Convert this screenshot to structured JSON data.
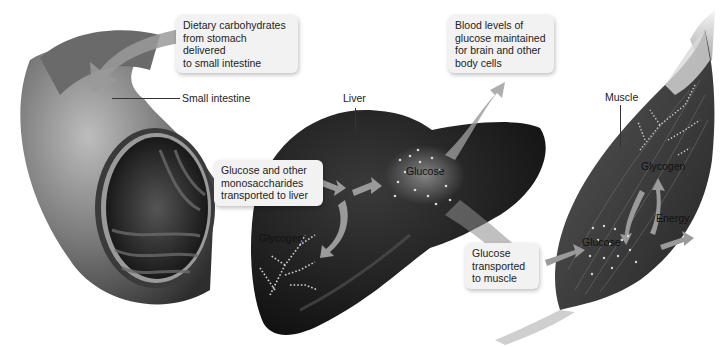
{
  "diagram": {
    "colors": {
      "background": "#ffffff",
      "callout_bg": "#f2f2f2",
      "intestine": "#5a5a5a",
      "liver": "#1e1e1e",
      "muscle": "#3c3c3c",
      "arrow": "#9a9a9a",
      "dots": "#d8d8d8"
    },
    "callouts": {
      "dietary": "Dietary carbohydrates\nfrom stomach delivered\nto small intestine",
      "to_liver": "Glucose and other\nmonosaccharides\ntransported to liver",
      "blood": "Blood levels of\nglucose maintained\nfor brain and other\nbody cells",
      "to_muscle": "Glucose\ntransported\nto muscle"
    },
    "labels": {
      "small_intestine": "Small intestine",
      "liver": "Liver",
      "liver_glucose": "Glucose",
      "liver_glycogen": "Glycogen",
      "muscle": "Muscle",
      "muscle_glycogen": "Glycogen",
      "muscle_glucose": "Glucose",
      "muscle_energy": "Energy"
    },
    "flows": [
      {
        "from": "stomach",
        "to": "small intestine"
      },
      {
        "from": "small intestine",
        "to": "liver"
      },
      {
        "from": "liver glucose",
        "to": "liver glycogen"
      },
      {
        "from": "liver glucose",
        "to": "blood"
      },
      {
        "from": "liver",
        "to": "muscle"
      },
      {
        "from": "muscle glucose",
        "to": "muscle glycogen"
      },
      {
        "from": "muscle glycogen",
        "to": "muscle glucose"
      },
      {
        "from": "muscle glucose",
        "to": "energy"
      }
    ]
  }
}
